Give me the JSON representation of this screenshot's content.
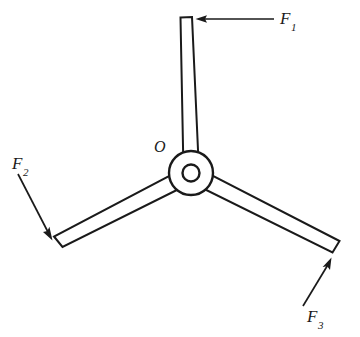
{
  "figure": {
    "name": "three-armed-rotor-force-diagram",
    "background_color": "#ffffff",
    "line_color": "#1a1a1a",
    "width": 360,
    "height": 337
  },
  "labels": {
    "center": {
      "base": "O",
      "sub": ""
    },
    "force1": {
      "base": "F",
      "sub": "1"
    },
    "force2": {
      "base": "F",
      "sub": "2"
    },
    "force3": {
      "base": "F",
      "sub": "3"
    }
  },
  "geometry": {
    "hub": {
      "center_x": 191,
      "center_y": 173,
      "outer_radius": 22,
      "inner_radius": 8.5
    },
    "arms": [
      {
        "name": "arm-top",
        "angle_deg": -86,
        "tip_x": 186,
        "tip_y": 18,
        "half_width": 6
      },
      {
        "name": "arm-lower-left",
        "angle_deg": 152,
        "tip_x": 57,
        "tip_y": 243,
        "half_width": 6
      },
      {
        "name": "arm-lower-right",
        "angle_deg": 28,
        "tip_x": 336,
        "tip_y": 247,
        "half_width": 6
      }
    ],
    "forces": [
      {
        "name": "force-arrow-1",
        "from_x": 274,
        "from_y": 19,
        "to_x": 196,
        "to_y": 19,
        "direction": "left"
      },
      {
        "name": "force-arrow-2",
        "from_x": 18,
        "from_y": 174,
        "to_x": 52,
        "to_y": 240,
        "direction": "down-right"
      },
      {
        "name": "force-arrow-3",
        "from_x": 303,
        "from_y": 306,
        "to_x": 331,
        "to_y": 258,
        "direction": "up-right"
      }
    ]
  }
}
